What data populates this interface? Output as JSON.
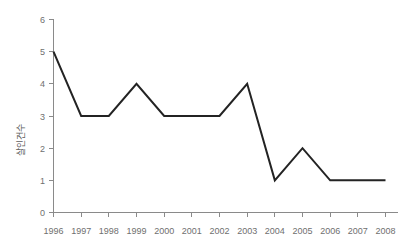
{
  "chart_data": {
    "type": "line",
    "title": "",
    "subtitle": "",
    "xlabel": "",
    "ylabel": "살인건수",
    "categories": [
      "1996",
      "1997",
      "1998",
      "1999",
      "2000",
      "2001",
      "2002",
      "2003",
      "2004",
      "2005",
      "2006",
      "2007",
      "2008"
    ],
    "values": [
      5,
      3,
      3,
      4,
      3,
      3,
      3,
      4,
      1,
      2,
      1,
      1,
      1
    ],
    "series": [
      {
        "name": "살인건수",
        "values": [
          5,
          3,
          3,
          4,
          3,
          3,
          3,
          4,
          1,
          2,
          1,
          1,
          1
        ]
      }
    ],
    "xlim": [
      "1996",
      "2008"
    ],
    "ylim": [
      0,
      6
    ],
    "ytick_labels": [
      "0",
      "1",
      "2",
      "3",
      "4",
      "5",
      "6"
    ],
    "ytick_values": [
      0,
      1,
      2,
      3,
      4,
      5,
      6
    ],
    "xtick_labels": [
      "1996",
      "1997",
      "1998",
      "1999",
      "2000",
      "2001",
      "2002",
      "2003",
      "2004",
      "2005",
      "2006",
      "2007",
      "2008"
    ],
    "grid": false,
    "legend": false,
    "legend_position": "none",
    "annotations": [],
    "colors": {
      "line": "#232323",
      "axis": "#8a8a8a",
      "tick_text": "#6f6f6f",
      "axis_label": "#5d5d5d",
      "background": "#ffffff"
    }
  }
}
